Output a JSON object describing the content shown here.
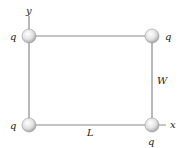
{
  "diagram": {
    "labels": {
      "y_axis": "y",
      "x_axis": "x",
      "length": "L",
      "width": "W",
      "charge": "q"
    },
    "charges": [
      {
        "position": "top-left",
        "label": "q"
      },
      {
        "position": "top-right",
        "label": "q"
      },
      {
        "position": "bottom-left",
        "label": "q"
      },
      {
        "position": "bottom-right",
        "label": "q"
      }
    ],
    "colors": {
      "line": "#8a8a8a",
      "sphere_light": "#ffffff",
      "sphere_dark": "#b0b0b0"
    }
  }
}
